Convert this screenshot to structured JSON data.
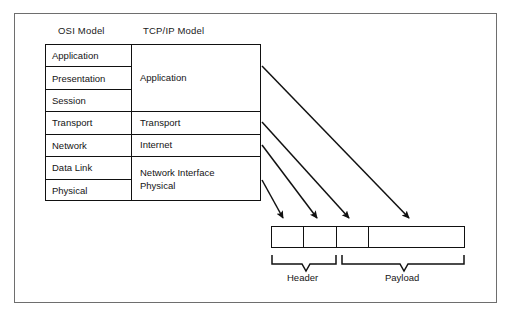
{
  "diagram": {
    "columns": {
      "osi_heading": "OSI Model",
      "tcp_heading": "TCP/IP Model"
    },
    "osi_layers": [
      {
        "label": "Application"
      },
      {
        "label": "Presentation"
      },
      {
        "label": "Session"
      },
      {
        "label": "Transport"
      },
      {
        "label": "Network"
      },
      {
        "label": "Data Link"
      },
      {
        "label": "Physical"
      }
    ],
    "tcpip_layers": [
      {
        "label": "Application",
        "spans": 3
      },
      {
        "label": "Transport",
        "spans": 1
      },
      {
        "label": "Internet",
        "spans": 1
      },
      {
        "label": "Network Interface\nPhysical",
        "spans": 2
      }
    ],
    "packet": {
      "cells": [
        {
          "name": "header-field-1",
          "label": ""
        },
        {
          "name": "header-field-2",
          "label": ""
        },
        {
          "name": "header-field-3",
          "label": ""
        },
        {
          "name": "payload-field",
          "label": ""
        }
      ],
      "braces": [
        {
          "name": "header-brace",
          "label": "Header"
        },
        {
          "name": "payload-brace",
          "label": "Payload"
        }
      ]
    },
    "arrows": [
      {
        "from": "Application",
        "to": "payload-field"
      },
      {
        "from": "Transport",
        "to": "header-field-3"
      },
      {
        "from": "Internet",
        "to": "header-field-2"
      },
      {
        "from": "Network Interface / Physical",
        "to": "header-field-1"
      }
    ],
    "colors": {
      "stroke": "#111111",
      "frame": "#6e6e6e",
      "background": "#ffffff",
      "text": "#141414"
    }
  }
}
